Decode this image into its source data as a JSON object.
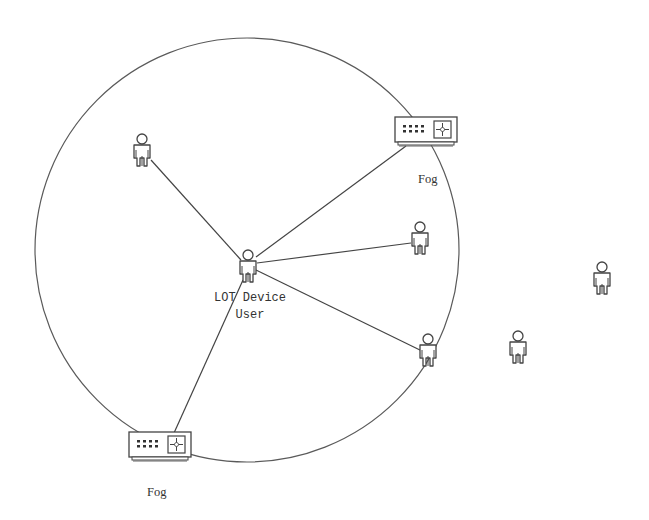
{
  "diagram": {
    "type": "network-topology",
    "boundary": {
      "shape": "circle",
      "cx": 247,
      "cy": 250,
      "r": 212,
      "stroke": "#555555"
    },
    "center_node": {
      "id": "iot-user",
      "label_line1": "LOT Device",
      "label_line2": "User",
      "x": 248,
      "y": 268
    },
    "nodes": [
      {
        "id": "fog-top",
        "kind": "fog-device",
        "label": "Fog",
        "x": 426,
        "y": 130
      },
      {
        "id": "fog-bottom",
        "kind": "fog-device",
        "label": "Fog",
        "x": 160,
        "y": 445
      },
      {
        "id": "user-top-left",
        "kind": "user",
        "x": 142,
        "y": 152
      },
      {
        "id": "user-right",
        "kind": "user",
        "x": 420,
        "y": 240
      },
      {
        "id": "user-lower-right",
        "kind": "user",
        "x": 428,
        "y": 352
      },
      {
        "id": "user-outside-1",
        "kind": "user",
        "x": 602,
        "y": 278
      },
      {
        "id": "user-outside-2",
        "kind": "user",
        "x": 518,
        "y": 347
      }
    ],
    "edges": [
      {
        "from": "iot-user",
        "to": "user-top-left",
        "x1": 241,
        "y1": 260,
        "x2": 151,
        "y2": 160
      },
      {
        "from": "iot-user",
        "to": "fog-top",
        "x1": 256,
        "y1": 257,
        "x2": 406,
        "y2": 147
      },
      {
        "from": "iot-user",
        "to": "user-right",
        "x1": 257,
        "y1": 263,
        "x2": 411,
        "y2": 243
      },
      {
        "from": "iot-user",
        "to": "user-lower-right",
        "x1": 256,
        "y1": 270,
        "x2": 422,
        "y2": 350
      },
      {
        "from": "iot-user",
        "to": "fog-bottom",
        "x1": 243,
        "y1": 280,
        "x2": 174,
        "y2": 434
      }
    ],
    "labels": {
      "fog_top": "Fog",
      "fog_bottom": "Fog",
      "center_line1": "LOT Device",
      "center_line2": "User"
    },
    "colors": {
      "stroke": "#444444",
      "circle": "#5a5a5a",
      "text": "#333333",
      "background": "#ffffff"
    }
  }
}
